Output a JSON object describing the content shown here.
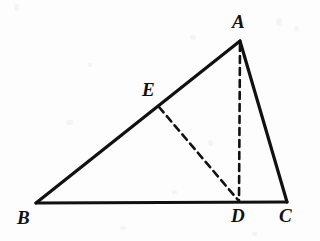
{
  "figure": {
    "width": 320,
    "height": 241,
    "background_color": "#fdfdfd",
    "ink_color": "#111111",
    "solid_stroke_width": 3.2,
    "dashed_stroke_width": 2.6,
    "dash_pattern": "7,5"
  },
  "points": {
    "A": {
      "label": "A",
      "x": 240,
      "y": 41,
      "label_x": 232,
      "label_y": 12
    },
    "B": {
      "label": "B",
      "x": 36,
      "y": 203,
      "label_x": 17,
      "label_y": 208
    },
    "C": {
      "label": "C",
      "x": 287,
      "y": 202,
      "label_x": 279,
      "label_y": 206
    },
    "D": {
      "label": "D",
      "x": 239,
      "y": 202,
      "label_x": 231,
      "label_y": 206
    },
    "E": {
      "label": "E",
      "x": 157,
      "y": 104,
      "label_x": 142,
      "label_y": 80
    }
  },
  "segments": [
    {
      "name": "side-BA",
      "from": "B",
      "to": "A",
      "style": "solid",
      "x1": 36,
      "y1": 203,
      "x2": 240,
      "y2": 41
    },
    {
      "name": "side-AC",
      "from": "A",
      "to": "C",
      "style": "solid",
      "x1": 240,
      "y1": 41,
      "x2": 287,
      "y2": 202
    },
    {
      "name": "side-BC",
      "from": "B",
      "to": "C",
      "style": "solid",
      "x1": 36,
      "y1": 203,
      "x2": 287,
      "y2": 202
    },
    {
      "name": "altitude-AD",
      "from": "A",
      "to": "D",
      "style": "dashed",
      "x1": 240,
      "y1": 44,
      "x2": 239,
      "y2": 201
    },
    {
      "name": "cevian-ED",
      "from": "E",
      "to": "D",
      "style": "dashed",
      "x1": 159,
      "y1": 107,
      "x2": 238,
      "y2": 200
    }
  ],
  "specks": [
    {
      "x": 14,
      "y": 4,
      "w": 5,
      "h": 7
    },
    {
      "x": 88,
      "y": 63,
      "w": 4,
      "h": 4
    },
    {
      "x": 190,
      "y": 35,
      "w": 6,
      "h": 5
    },
    {
      "x": 66,
      "y": 120,
      "w": 7,
      "h": 5
    },
    {
      "x": 208,
      "y": 140,
      "w": 5,
      "h": 6
    },
    {
      "x": 276,
      "y": 18,
      "w": 6,
      "h": 8
    },
    {
      "x": 294,
      "y": 26,
      "w": 5,
      "h": 5
    },
    {
      "x": 120,
      "y": 226,
      "w": 6,
      "h": 4
    },
    {
      "x": 252,
      "y": 232,
      "w": 5,
      "h": 4
    },
    {
      "x": 172,
      "y": 190,
      "w": 5,
      "h": 4
    }
  ]
}
